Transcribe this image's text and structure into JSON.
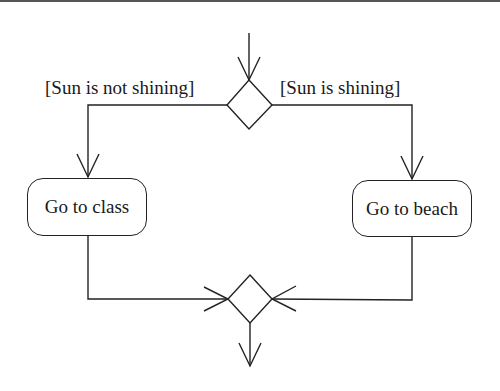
{
  "diagram": {
    "type": "uml-activity",
    "guards": {
      "left": "[Sun is not shining]",
      "right": "[Sun is shining]"
    },
    "actions": [
      {
        "id": "go-to-class",
        "label": "Go to class"
      },
      {
        "id": "go-to-beach",
        "label": "Go to beach"
      }
    ],
    "decision": {
      "kind": "decision-node"
    },
    "merge": {
      "kind": "merge-node"
    },
    "colors": {
      "stroke": "#222222",
      "background": "#ffffff",
      "border": "#555555"
    }
  }
}
